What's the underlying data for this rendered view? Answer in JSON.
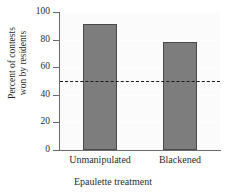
{
  "chart_data": {
    "type": "bar",
    "title": "",
    "xlabel": "Epaulette treatment",
    "ylabel_line1": "Percent of contests",
    "ylabel_line2": "won by residents",
    "ylabel": "Percent of contests won by residents",
    "categories": [
      "Unmanipulated",
      "Blackened"
    ],
    "values": [
      91,
      78
    ],
    "ylim": [
      0,
      100
    ],
    "yticks": [
      "0",
      "20",
      "40",
      "60",
      "80",
      "100"
    ],
    "ytick_values": [
      0,
      20,
      40,
      60,
      80,
      100
    ],
    "grid": false,
    "legend": "none",
    "reference_line": {
      "value": 50,
      "style": "dashed",
      "color": "#1a1a1a"
    },
    "colors": {
      "bar_fill": "#7d7d7d",
      "bar_edge": "#4a4a4a",
      "plot_background": "#fbfbfb",
      "axis": "#6a6a6a",
      "text": "#2b2b2b"
    }
  }
}
